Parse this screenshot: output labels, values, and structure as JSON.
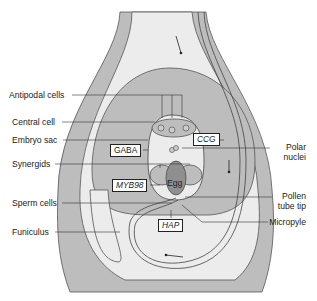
{
  "figure": {
    "type": "ovule-anatomy-diagram",
    "left_labels": [
      {
        "id": "antipodal",
        "text": "Antipodal cells"
      },
      {
        "id": "central",
        "text": "Central cell"
      },
      {
        "id": "embryo_sac",
        "text": "Embryo sac"
      },
      {
        "id": "synergids",
        "text": "Synergids"
      },
      {
        "id": "sperm",
        "text": "Sperm cells"
      },
      {
        "id": "funiculus",
        "text": "Funiculus"
      }
    ],
    "right_labels": [
      {
        "id": "polar",
        "text": "Polar\nnuclei",
        "line1": "Polar",
        "line2": "nuclei"
      },
      {
        "id": "pollen_tip",
        "line1": "Pollen",
        "line2": "tube tip"
      },
      {
        "id": "micropyle",
        "text": "Micropyle"
      }
    ],
    "boxed_labels": [
      {
        "id": "ccg",
        "text": "CCG",
        "italic": true
      },
      {
        "id": "gaba",
        "text": "GABA",
        "italic": false
      },
      {
        "id": "myb98",
        "text": "MYB98",
        "italic": true
      },
      {
        "id": "hap",
        "text": "HAP",
        "italic": true
      }
    ],
    "inner_labels": {
      "egg": "Egg"
    },
    "colors": {
      "tissue": "#bdbdbd",
      "light": "#ececec",
      "egg": "#8f8f8f",
      "line": "#333333"
    }
  }
}
